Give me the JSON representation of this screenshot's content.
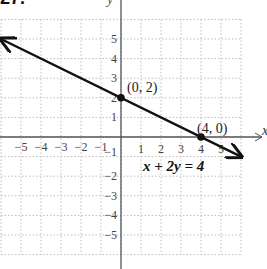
{
  "header": {
    "problem_number_fragment": "27."
  },
  "chart_data": {
    "type": "line",
    "title": "",
    "xlabel": "x",
    "ylabel": "y",
    "xlim": [
      -6,
      6
    ],
    "ylim": [
      -6,
      6
    ],
    "grid": true,
    "grid_style": "dotted",
    "x_ticks": [
      -5,
      -4,
      -3,
      -2,
      -1,
      1,
      2,
      3,
      4,
      5
    ],
    "y_ticks": [
      -5,
      -4,
      -3,
      -2,
      -1,
      1,
      2,
      3,
      4,
      5
    ],
    "x_tick_labels": [
      "−5",
      "−4",
      "−3",
      "−2",
      "−1",
      "1",
      "2",
      "3",
      "4",
      "5"
    ],
    "y_tick_labels": [
      "−5",
      "−4",
      "−3",
      "−2",
      "−1",
      "1",
      "2",
      "3",
      "4",
      "5"
    ],
    "series": [
      {
        "name": "x + 2y = 4",
        "equation": "x + 2y = 4",
        "slope": -0.5,
        "intercept": 2,
        "x": [
          -6,
          6
        ],
        "y": [
          5,
          -1
        ],
        "arrows": "both",
        "color": "#111111"
      }
    ],
    "points": [
      {
        "x": 0,
        "y": 2,
        "label": "(0, 2)"
      },
      {
        "x": 4,
        "y": 0,
        "label": "(4, 0)"
      }
    ],
    "annotations": [
      {
        "text": "x + 2y = 4",
        "x": 3,
        "y": -2.5
      }
    ]
  }
}
